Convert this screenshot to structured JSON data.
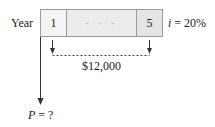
{
  "diagram": {
    "type": "cash-flow-diagram",
    "axis_label": "Year",
    "periods": [
      {
        "label": "1"
      },
      {
        "label": "· · ·"
      },
      {
        "label": "5"
      }
    ],
    "interest_rate": {
      "symbol": "i",
      "equals": "= 20%",
      "value_percent": 20
    },
    "annuity": {
      "amount_label": "$12,000",
      "amount": 12000,
      "from_year": 1,
      "to_year": 5,
      "direction": "down"
    },
    "present_value": {
      "symbol": "P",
      "equals": "= ?",
      "direction": "down"
    },
    "colors": {
      "line": "#333333",
      "box_border": "#9a9a9a",
      "box_fill": "#ececec"
    }
  }
}
